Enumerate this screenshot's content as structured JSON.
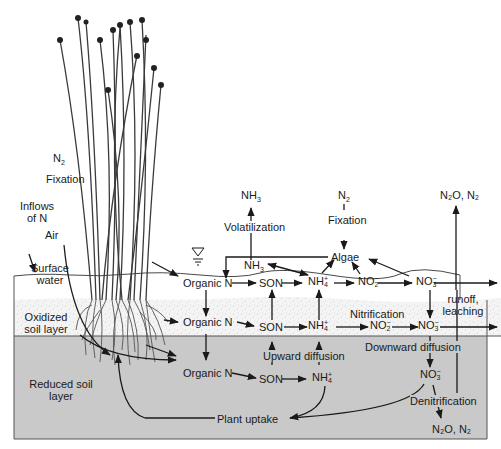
{
  "layers": {
    "air": "Air",
    "surface_water": [
      "Surface",
      "water"
    ],
    "oxidized": [
      "Oxidized",
      "soil layer"
    ],
    "reduced": [
      "Reduced soil",
      "layer"
    ]
  },
  "inputs": {
    "n2_left": {
      "base": "N",
      "sub": "2"
    },
    "fixation_left": "Fixation",
    "inflows": [
      "Inflows",
      "of N"
    ],
    "nh3_top": {
      "base": "NH",
      "sub": "3"
    },
    "volatilization": "Volatilization",
    "n2_mid": {
      "base": "N",
      "sub": "2"
    },
    "fixation_mid": "Fixation",
    "n2o_top": "N₂O, N₂"
  },
  "water_column": {
    "algae": "Algae",
    "nh3": {
      "base": "NH",
      "sub": "3"
    },
    "organic_n": "Organic N",
    "son": "SON",
    "nh4": {
      "base": "NH",
      "sup": "+",
      "sub": "4"
    },
    "no2": {
      "base": "NO",
      "sup": "−",
      "sub": "2"
    },
    "no3": {
      "base": "NO",
      "sup": "−",
      "sub": "3"
    },
    "runoff": [
      "runoff,",
      "leaching"
    ]
  },
  "oxidized_layer": {
    "organic_n": "Organic N",
    "son": "SON",
    "nh4": {
      "base": "NH",
      "sup": "+",
      "sub": "4"
    },
    "nitrification": "Nitrification",
    "no2": {
      "base": "NO",
      "sup": "−",
      "sub": "2"
    },
    "no3": {
      "base": "NO",
      "sup": "−",
      "sub": "3"
    }
  },
  "reduced_layer": {
    "upward_diffusion": "Upward diffusion",
    "downward_diffusion": "Downward diffusion",
    "organic_n": "Organic N",
    "son": "SON",
    "nh4": {
      "base": "NH",
      "sup": "+",
      "sub": "4"
    },
    "no3": {
      "base": "NO",
      "sup": "−",
      "sub": "3"
    },
    "denitrification": "Denitrification",
    "n2o_bottom": "N₂O,  N₂",
    "plant_uptake": "Plant uptake"
  },
  "colors": {
    "water": "#ffffff",
    "oxidized": "#f2f2f2",
    "reduced": "#c9c9c9",
    "line": "#1a1a1a",
    "plant": "#444444"
  }
}
